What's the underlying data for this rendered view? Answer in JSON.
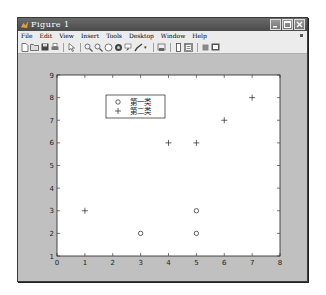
{
  "window": {
    "title": "Figure 1",
    "controls": [
      "minimize",
      "maximize",
      "close"
    ]
  },
  "menubar": {
    "items": [
      {
        "label": "File"
      },
      {
        "label": "Edit"
      },
      {
        "label": "View"
      },
      {
        "label": "Insert"
      },
      {
        "label": "Tools"
      },
      {
        "label": "Desktop"
      },
      {
        "label": "Window"
      },
      {
        "label": "Help"
      }
    ]
  },
  "toolbar": {
    "buttons": [
      {
        "icon": "new-figure-icon"
      },
      {
        "icon": "open-file-icon"
      },
      {
        "icon": "save-icon"
      },
      {
        "icon": "print-icon"
      },
      {
        "icon": "edit-plot-arrow-icon"
      },
      {
        "icon": "zoom-in-icon"
      },
      {
        "icon": "zoom-out-icon"
      },
      {
        "icon": "pan-icon"
      },
      {
        "icon": "rotate-3d-icon"
      },
      {
        "icon": "data-cursor-icon"
      },
      {
        "icon": "brush-icon"
      },
      {
        "icon": "link-plot-icon"
      },
      {
        "icon": "colorbar-icon"
      },
      {
        "icon": "legend-icon"
      },
      {
        "icon": "hide-plot-tools-icon"
      },
      {
        "icon": "show-plot-tools-icon"
      }
    ]
  },
  "chart_data": {
    "type": "scatter",
    "title": "",
    "xlabel": "",
    "ylabel": "",
    "xlim": [
      0,
      8
    ],
    "ylim": [
      1,
      9
    ],
    "xticks": [
      0,
      1,
      2,
      3,
      4,
      5,
      6,
      7,
      8
    ],
    "yticks": [
      1,
      2,
      3,
      4,
      5,
      6,
      7,
      8,
      9
    ],
    "grid": false,
    "legend_position": "upper-left-inside",
    "series": [
      {
        "name": "第一类",
        "marker": "o",
        "x": [
          3,
          5,
          5
        ],
        "y": [
          2,
          2,
          3
        ]
      },
      {
        "name": "第二类",
        "marker": "+",
        "x": [
          1,
          4,
          5,
          6,
          7
        ],
        "y": [
          3,
          6,
          6,
          7,
          8
        ]
      }
    ]
  }
}
